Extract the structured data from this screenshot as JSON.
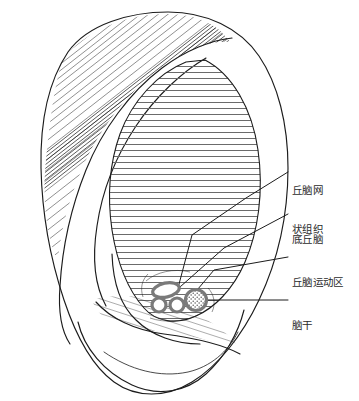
{
  "figure": {
    "name": "auricular-thalamus-region-diagram",
    "description_visible": false,
    "background_color": "#ffffff",
    "ink_color": "#1c1c1c",
    "hatch_color": "#6b6b6b",
    "marker_color": "#7a7a7a",
    "leader_color": "#1c1c1c"
  },
  "annotations": [
    {
      "id": "thalamic-reticular-formation",
      "lines": [
        "丘脑网",
        "状组织"
      ],
      "text": "丘脑网状组织",
      "label_x": 292,
      "label_y": 158,
      "leader": "M 286 176 L 246 200 L 190 237 L 177 291",
      "target_x": 177,
      "target_y": 291
    },
    {
      "id": "subthalamus",
      "lines": [
        "底丘脑"
      ],
      "text": "底丘脑",
      "label_x": 292,
      "label_y": 210,
      "leader": "M 286 215 L 222 248 L 177 288",
      "target_x": 177,
      "target_y": 288
    },
    {
      "id": "thalamic-motor-area",
      "lines": [
        "丘脑运动区"
      ],
      "text": "丘脑运动区",
      "label_x": 292,
      "label_y": 253,
      "leader": "M 286 258 L 213 271 L 190 298",
      "target_x": 190,
      "target_y": 298
    },
    {
      "id": "brainstem",
      "lines": [
        "脑干"
      ],
      "text": "脑干",
      "label_x": 292,
      "label_y": 297,
      "leader": "M 286 301 L 198 301",
      "target_x": 198,
      "target_y": 301
    }
  ],
  "markers": [
    {
      "id": "marker-elongated-oval",
      "shape": "rounded-oval",
      "cx": 166,
      "cy": 291,
      "rx": 13,
      "ry": 7,
      "rotation": -12,
      "fill": "#ffffff",
      "stroke": "#7a7a7a",
      "stroke_width": 3
    },
    {
      "id": "marker-circle-left",
      "shape": "circle",
      "cx": 160,
      "cy": 305,
      "rx": 7,
      "ry": 7,
      "rotation": 0,
      "fill": "#ffffff",
      "stroke": "#7a7a7a",
      "stroke_width": 3
    },
    {
      "id": "marker-circle-right",
      "shape": "circle",
      "cx": 177,
      "cy": 305,
      "rx": 7,
      "ry": 7,
      "rotation": 0,
      "fill": "#ffffff",
      "stroke": "#7a7a7a",
      "stroke_width": 3
    },
    {
      "id": "marker-stippled-circle",
      "shape": "stippled-circle",
      "cx": 196,
      "cy": 300,
      "rx": 11,
      "ry": 11,
      "rotation": 0,
      "fill": "#ffffff",
      "stroke": "#7a7a7a",
      "stroke_width": 3
    }
  ],
  "hatched_region": {
    "id": "concha-hatched-zone",
    "pattern": "horizontal-lines",
    "line_spacing_px": 6,
    "line_color": "#6b6b6b",
    "line_width": 1
  }
}
